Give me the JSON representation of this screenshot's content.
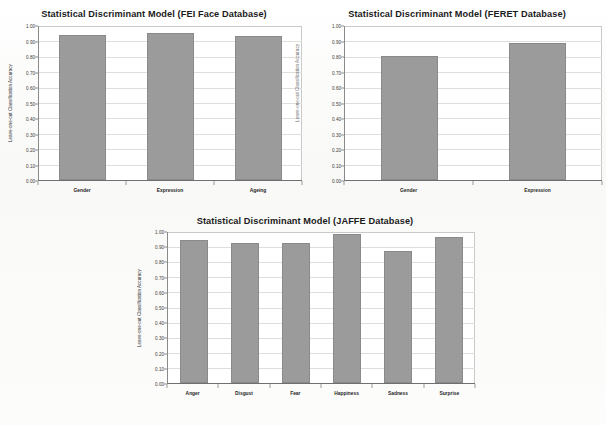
{
  "figure": {
    "y_axis_label": "Leave-one-out Classification Accuracy",
    "y_ticks": [
      "1.00",
      "0.90",
      "0.80",
      "0.70",
      "0.60",
      "0.50",
      "0.40",
      "0.30",
      "0.20",
      "0.10",
      "0.00"
    ],
    "bar_color": "#9b9b9b",
    "background_color": "#ffffff",
    "grid_color": "#dedeida"
  },
  "chart_data": [
    {
      "id": "fei",
      "type": "bar",
      "title": "Statistical Discriminant Model (FEI Face Database)",
      "categories": [
        "Gender",
        "Expression",
        "Ageing"
      ],
      "values": [
        0.94,
        0.955,
        0.935
      ],
      "xlabel": "",
      "ylabel": "Leave-one-out Classification Accuracy",
      "ylim": [
        0.0,
        1.0
      ],
      "ytick_step": 0.1,
      "grid": true,
      "legend": "none"
    },
    {
      "id": "feret",
      "type": "bar",
      "title": "Statistical Discriminant Model (FERET Database)",
      "categories": [
        "Gender",
        "Expression"
      ],
      "values": [
        0.805,
        0.89
      ],
      "xlabel": "",
      "ylabel": "Leave-one-out Classification Accuracy",
      "ylim": [
        0.0,
        1.0
      ],
      "ytick_step": 0.1,
      "grid": true,
      "legend": "none"
    },
    {
      "id": "jaffe",
      "type": "bar",
      "title": "Statistical Discriminant Model (JAFFE Database)",
      "categories": [
        "Anger",
        "Disgust",
        "Fear",
        "Happiness",
        "Sadness",
        "Surprise"
      ],
      "values": [
        0.945,
        0.925,
        0.925,
        0.985,
        0.875,
        0.97
      ],
      "xlabel": "",
      "ylabel": "Leave-one-out Classification Accuracy",
      "ylim": [
        0.0,
        1.0
      ],
      "ytick_step": 0.1,
      "grid": true,
      "legend": "none"
    }
  ]
}
